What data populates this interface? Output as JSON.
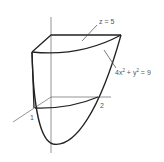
{
  "figure": {
    "labels": {
      "top_plane": "z = 5",
      "cylinder_eq_a": "4x",
      "cylinder_exp_a": "2",
      "cylinder_eq_b": " + y",
      "cylinder_exp_b": "2",
      "cylinder_eq_c": " = 9",
      "x_intercept": "1",
      "y_intercept": "2"
    },
    "colors": {
      "outline": "#222222",
      "axis": "#555555",
      "label": "#555555"
    }
  }
}
